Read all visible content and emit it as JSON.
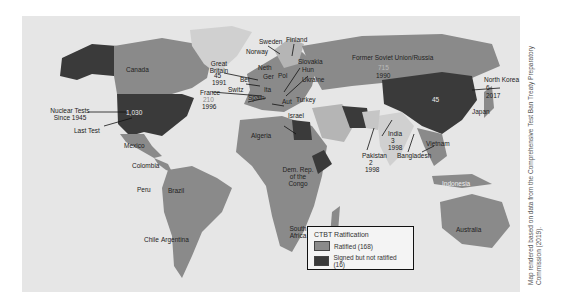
{
  "map": {
    "title": "CTBT Ratification world map",
    "colors": {
      "ocean": "#e6e6e6",
      "ratified": "#8a8a8a",
      "signed_not_ratified": "#3a3a3a",
      "not_signed": "#d0d0d0"
    },
    "country_labels": [
      {
        "id": "canada",
        "text": "Canada"
      },
      {
        "id": "mexico",
        "text": "Mexico"
      },
      {
        "id": "colombia",
        "text": "Colombia"
      },
      {
        "id": "peru",
        "text": "Peru"
      },
      {
        "id": "brazil",
        "text": "Brazil"
      },
      {
        "id": "chile",
        "text": "Chile"
      },
      {
        "id": "argentina",
        "text": "Argentina"
      },
      {
        "id": "algeria",
        "text": "Algeria"
      },
      {
        "id": "drc",
        "text": "Dem. Rep. of the Congo"
      },
      {
        "id": "south_africa",
        "text": "South Africa"
      },
      {
        "id": "spain",
        "text": "Spain"
      },
      {
        "id": "sweden",
        "text": "Sweden"
      },
      {
        "id": "norway",
        "text": "Norway"
      },
      {
        "id": "finland",
        "text": "Finland"
      },
      {
        "id": "neth",
        "text": "Neth"
      },
      {
        "id": "bel",
        "text": "Bel"
      },
      {
        "id": "switz",
        "text": "Switz"
      },
      {
        "id": "ger",
        "text": "Ger"
      },
      {
        "id": "pol",
        "text": "Pol"
      },
      {
        "id": "slovakia",
        "text": "Slovakia"
      },
      {
        "id": "hun",
        "text": "Hun"
      },
      {
        "id": "ukraine",
        "text": "Ukraine"
      },
      {
        "id": "ita",
        "text": "Ita"
      },
      {
        "id": "aut",
        "text": "Aut"
      },
      {
        "id": "turkey",
        "text": "Turkey"
      },
      {
        "id": "israel",
        "text": "Israel"
      },
      {
        "id": "bangladesh",
        "text": "Bangladesh"
      },
      {
        "id": "vietnam",
        "text": "Vietnam"
      },
      {
        "id": "japan",
        "text": "Japan"
      },
      {
        "id": "indonesia",
        "text": "Indonesia"
      },
      {
        "id": "australia",
        "text": "Australia"
      }
    ],
    "nuclear_annotations": {
      "usa": {
        "tests_label": "Nuclear Tests Since 1945",
        "count": "1,030",
        "last_test_label": "Last Test"
      },
      "great_britain": {
        "name": "Great Britain",
        "count": "45",
        "year": "1991"
      },
      "france": {
        "name": "France",
        "count": "210",
        "year": "1996"
      },
      "ussr": {
        "name": "Former Soviet Union/Russia",
        "count": "715",
        "year": "1990"
      },
      "china": {
        "count": "45"
      },
      "north_korea": {
        "name": "North Korea",
        "count": "6",
        "year": "2017"
      },
      "india": {
        "name": "India",
        "count": "3",
        "year": "1998"
      },
      "pakistan": {
        "name": "Pakistan",
        "count": "2",
        "year": "1998"
      }
    }
  },
  "legend": {
    "title": "CTBT Ratification",
    "items": [
      {
        "label": "Ratified (168)",
        "color": "#8a8a8a"
      },
      {
        "label": "Signed but not ratified (16)",
        "color": "#3a3a3a"
      }
    ]
  },
  "credit": "Map rendered based on data from the Comprehensive Test Ban Treaty Preparatory Commission (2019)."
}
